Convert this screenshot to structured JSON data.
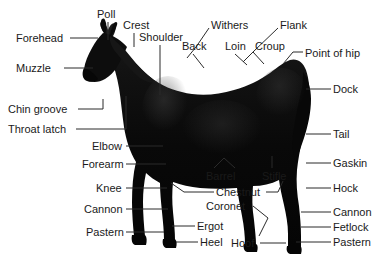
{
  "diagram": {
    "background_color": "#ffffff",
    "label_color": "#1a1a1a",
    "leader_color": "#2b2b2b",
    "horse_color": "#0a0a0a"
  },
  "labels": [
    {
      "id": "poll",
      "text": "Poll",
      "x": 97,
      "y": 8,
      "align": "left"
    },
    {
      "id": "crest",
      "text": "Crest",
      "x": 123,
      "y": 19,
      "align": "left"
    },
    {
      "id": "shoulder",
      "text": "Shoulder",
      "x": 139,
      "y": 31,
      "align": "left"
    },
    {
      "id": "withers",
      "text": "Withers",
      "x": 211,
      "y": 19,
      "align": "left"
    },
    {
      "id": "flank",
      "text": "Flank",
      "x": 280,
      "y": 19,
      "align": "left"
    },
    {
      "id": "back",
      "text": "Back",
      "x": 182,
      "y": 40,
      "align": "left"
    },
    {
      "id": "loin",
      "text": "Loin",
      "x": 225,
      "y": 40,
      "align": "left"
    },
    {
      "id": "croup",
      "text": "Croup",
      "x": 255,
      "y": 40,
      "align": "left"
    },
    {
      "id": "point-of-hip",
      "text": "Point of hip",
      "x": 305,
      "y": 47,
      "align": "left"
    },
    {
      "id": "forehead",
      "text": "Forehead",
      "x": 16,
      "y": 32,
      "align": "left"
    },
    {
      "id": "muzzle",
      "text": "Muzzle",
      "x": 16,
      "y": 62,
      "align": "left"
    },
    {
      "id": "chin-groove",
      "text": "Chin groove",
      "x": 8,
      "y": 103,
      "align": "left"
    },
    {
      "id": "throat-latch",
      "text": "Throat latch",
      "x": 8,
      "y": 123,
      "align": "left"
    },
    {
      "id": "dock",
      "text": "Dock",
      "x": 333,
      "y": 83,
      "align": "left"
    },
    {
      "id": "tail",
      "text": "Tail",
      "x": 333,
      "y": 128,
      "align": "left"
    },
    {
      "id": "gaskin",
      "text": "Gaskin",
      "x": 333,
      "y": 157,
      "align": "left"
    },
    {
      "id": "hock",
      "text": "Hock",
      "x": 333,
      "y": 182,
      "align": "left"
    },
    {
      "id": "cannon-rear",
      "text": "Cannon",
      "x": 333,
      "y": 206,
      "align": "left"
    },
    {
      "id": "fetlock",
      "text": "Fetlock",
      "x": 333,
      "y": 221,
      "align": "left"
    },
    {
      "id": "pastern-rear",
      "text": "Pastern",
      "x": 333,
      "y": 236,
      "align": "left"
    },
    {
      "id": "elbow",
      "text": "Elbow",
      "x": 92,
      "y": 140,
      "align": "left"
    },
    {
      "id": "forearm",
      "text": "Forearm",
      "x": 82,
      "y": 158,
      "align": "left"
    },
    {
      "id": "knee",
      "text": "Knee",
      "x": 96,
      "y": 182,
      "align": "left"
    },
    {
      "id": "cannon-front",
      "text": "Cannon",
      "x": 84,
      "y": 203,
      "align": "left"
    },
    {
      "id": "pastern-front",
      "text": "Pastern",
      "x": 86,
      "y": 226,
      "align": "left"
    },
    {
      "id": "barrel",
      "text": "Barrel",
      "x": 206,
      "y": 170,
      "align": "left"
    },
    {
      "id": "stifle",
      "text": "Stifle",
      "x": 262,
      "y": 170,
      "align": "left"
    },
    {
      "id": "chestnut",
      "text": "Chestnut",
      "x": 216,
      "y": 186,
      "align": "left"
    },
    {
      "id": "coronet",
      "text": "Coronet",
      "x": 206,
      "y": 200,
      "align": "left"
    },
    {
      "id": "ergot",
      "text": "Ergot",
      "x": 197,
      "y": 220,
      "align": "left"
    },
    {
      "id": "heel",
      "text": "Heel",
      "x": 200,
      "y": 236,
      "align": "left"
    },
    {
      "id": "hoof",
      "text": "Hoof",
      "x": 231,
      "y": 237,
      "align": "left"
    }
  ],
  "leaders": [
    {
      "id": "poll",
      "points": "108,22 108,40"
    },
    {
      "id": "crest",
      "points": "134,33 134,47"
    },
    {
      "id": "shoulder",
      "points": "160,45 160,95"
    },
    {
      "id": "withers",
      "points": "209,28 196,47 187,58"
    },
    {
      "id": "flank",
      "points": "278,28 254,51 243,62"
    },
    {
      "id": "back",
      "points": "193,54 204,68"
    },
    {
      "id": "loin",
      "points": "235,54 247,65"
    },
    {
      "id": "croup",
      "points": "253,52 264,64"
    },
    {
      "id": "point-of-hip",
      "points": "303,52 293,52 283,64"
    },
    {
      "id": "forehead",
      "points": "70,38 98,38"
    },
    {
      "id": "muzzle",
      "points": "64,68 93,68"
    },
    {
      "id": "chin-groove",
      "points": "78,109 103,109 103,99"
    },
    {
      "id": "throat-latch",
      "points": "76,129 126,129 126,96"
    },
    {
      "id": "dock",
      "points": "331,89 306,89"
    },
    {
      "id": "tail",
      "points": "331,134 306,134"
    },
    {
      "id": "gaskin",
      "points": "331,163 306,163"
    },
    {
      "id": "hock",
      "points": "331,188 306,188"
    },
    {
      "id": "cannon-rear",
      "points": "331,212 301,212"
    },
    {
      "id": "fetlock",
      "points": "331,227 301,227"
    },
    {
      "id": "pastern-rear",
      "points": "331,242 296,242"
    },
    {
      "id": "elbow",
      "points": "126,146 163,146"
    },
    {
      "id": "forearm",
      "points": "126,164 166,164"
    },
    {
      "id": "knee",
      "points": "126,188 167,188"
    },
    {
      "id": "cannon-front",
      "points": "126,209 168,209"
    },
    {
      "id": "pastern-front",
      "points": "126,232 164,232"
    },
    {
      "id": "barrel",
      "points": "214,168 224,158 235,168"
    },
    {
      "id": "stifle",
      "points": "272,168 272,156"
    },
    {
      "id": "chestnut-left",
      "points": "214,192 184,192 171,183"
    },
    {
      "id": "chestnut-right",
      "points": "266,192 278,192 283,181"
    },
    {
      "id": "coronet",
      "points": "253,206 268,218 259,236"
    },
    {
      "id": "ergot",
      "points": "195,226 172,226"
    },
    {
      "id": "heel",
      "points": "198,242 176,242"
    },
    {
      "id": "hoof",
      "points": "260,243 286,243"
    }
  ]
}
